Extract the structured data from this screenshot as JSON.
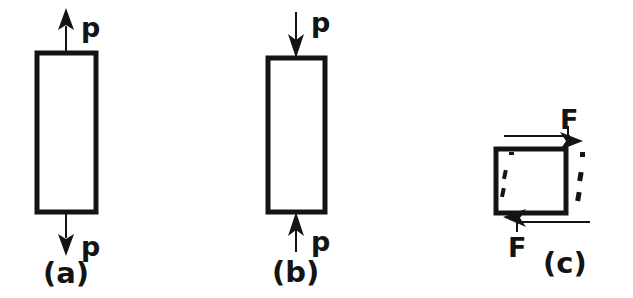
{
  "figure": {
    "kind": "engineering-stress-diagram",
    "background_color": "#ffffff",
    "ink_color": "#141414",
    "panels": [
      {
        "id": "a",
        "panel_label": "(a)",
        "stress_type": "tension",
        "body_shape": "rectangle",
        "top_force_label": "p",
        "bottom_force_label": "p",
        "top_arrow_direction": "up",
        "bottom_arrow_direction": "down"
      },
      {
        "id": "b",
        "panel_label": "(b)",
        "stress_type": "compression",
        "body_shape": "rectangle",
        "top_force_label": "p",
        "bottom_force_label": "p",
        "top_arrow_direction": "down",
        "bottom_arrow_direction": "up"
      },
      {
        "id": "c",
        "panel_label": "(c)",
        "stress_type": "shear",
        "body_shape": "square",
        "top_force_label": "F",
        "bottom_force_label": "F",
        "top_arrow_direction": "right",
        "bottom_arrow_direction": "left"
      }
    ]
  },
  "labels": {
    "panel_a_top_force": "p",
    "panel_a_bottom_force": "p",
    "panel_a_caption": "(a)",
    "panel_b_top_force": "p",
    "panel_b_bottom_force": "p",
    "panel_b_caption": "(b)",
    "panel_c_top_force": "F",
    "panel_c_bottom_force": "F",
    "panel_c_caption": "(c)"
  }
}
